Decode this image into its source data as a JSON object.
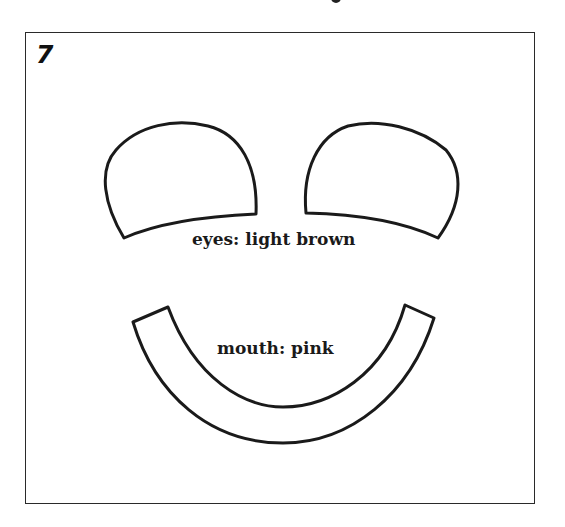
{
  "page": {
    "panel_number": "7"
  },
  "pieces": {
    "eyes": {
      "label": "eyes: light brown",
      "color_name": "light brown"
    },
    "mouth": {
      "label": "mouth: pink",
      "color_name": "pink"
    }
  },
  "colors": {
    "outline": "#1a1a1a",
    "background": "#ffffff"
  }
}
